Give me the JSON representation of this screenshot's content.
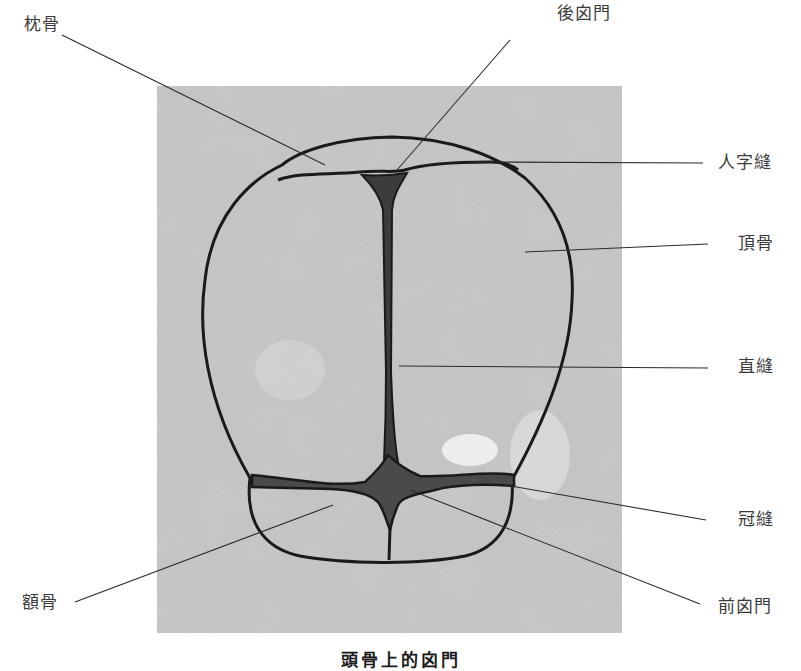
{
  "figure": {
    "colors": {
      "background": "#ffffff",
      "texture_base": "#b9b9b9",
      "texture_dark": "#8f8f8f",
      "outline": "#1a1a1a",
      "fontanelle_fill": "#4a4a4a",
      "leader_line": "#2b2b2b",
      "label_text": "#3a3a3a"
    },
    "labels": {
      "occipital_bone": "枕骨",
      "posterior_fontanelle": "後囟門",
      "lambdoid_suture": "人字縫",
      "parietal_bone": "頂骨",
      "sagittal_suture": "直縫",
      "coronal_suture": "冠縫",
      "frontal_bone": "額骨",
      "anterior_fontanelle": "前囟門"
    },
    "caption": "頭骨上的囟門"
  }
}
